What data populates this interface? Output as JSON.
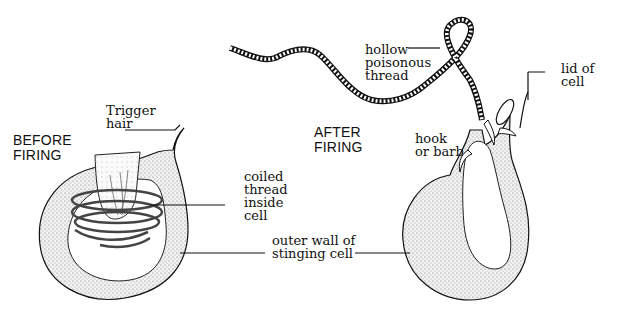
{
  "diagram": {
    "panels": [
      {
        "title": "BEFORE\nFIRING",
        "labels": [
          "Trigger\nhair",
          "coiled\nthread\ninside\ncell"
        ]
      },
      {
        "title": "AFTER\nFIRING",
        "labels": [
          "hollow\npoisonous\nthread",
          "lid of\ncell",
          "hook\nor barb"
        ]
      }
    ],
    "shared_label": "outer wall of\nstinging cell"
  },
  "colors": {
    "ink": "#111111",
    "background": "#ffffff",
    "stipple": "#9a9a9a"
  }
}
